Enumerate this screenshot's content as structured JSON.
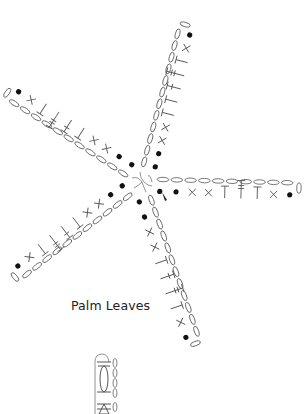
{
  "diagram": {
    "title": "Palm Leaves",
    "type": "crochet stitch chart",
    "center": [
      142,
      182
    ],
    "line_color": "#555555",
    "dot_color": "#111111",
    "legend_symbols": {
      "chain": "oval",
      "slip_stitch": "dot",
      "single_crochet": "x",
      "half_double_crochet": "T",
      "double_crochet": "T with one bar",
      "treble": "T with two bars"
    },
    "arms": [
      {
        "name": "north",
        "angle_deg": -74,
        "tip": [
          183,
          25
        ],
        "chain_count": 12,
        "stitches": [
          "sl",
          "sl",
          "sc",
          "sc",
          "hdc",
          "hdc",
          "dc",
          "tr",
          "hdc",
          "sc",
          "sl"
        ]
      },
      {
        "name": "east",
        "angle_deg": 0,
        "tip": [
          298,
          186
        ],
        "chain_count": 10,
        "stitches": [
          "sl",
          "sl",
          "sc",
          "sc",
          "hdc",
          "tr",
          "hdc",
          "sc",
          "sl"
        ]
      },
      {
        "name": "southeast",
        "angle_deg": 72,
        "tip": [
          197,
          342
        ],
        "chain_count": 12,
        "stitches": [
          "sl",
          "sl",
          "sc",
          "sc",
          "hdc",
          "dc",
          "tr",
          "hdc",
          "sc",
          "sl"
        ]
      },
      {
        "name": "southwest",
        "angle_deg": 148,
        "tip": [
          17,
          278
        ],
        "chain_count": 11,
        "stitches": [
          "sl",
          "sl",
          "sc",
          "sc",
          "hdc",
          "dc",
          "tr",
          "hdc",
          "sc",
          "sl"
        ]
      },
      {
        "name": "northwest",
        "angle_deg": -152,
        "tip": [
          7,
          95
        ],
        "chain_count": 11,
        "stitches": [
          "sl",
          "sl",
          "sc",
          "sc",
          "hdc",
          "dc",
          "tr",
          "hdc",
          "sc",
          "sl"
        ]
      }
    ],
    "secondary_diagram": {
      "description": "partial stitch detail",
      "position": [
        95,
        352
      ]
    }
  }
}
